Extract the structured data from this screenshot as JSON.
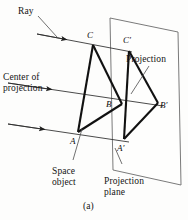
{
  "figure": {
    "caption": "(a)",
    "colors": {
      "ink": "#141414",
      "object_stroke": "#111111",
      "plane_stroke": "#5a5a5a",
      "ray_stroke": "#333333",
      "leader_stroke": "#555555",
      "background": "#fdfdfc"
    },
    "annotations": {
      "ray": "Ray",
      "center_of_projection": "Center of\nprojection",
      "projection": "Projection",
      "space_object": "Space\nobject",
      "projection_plane": "Projection\nplane"
    },
    "vertices": {
      "c": "C",
      "c_prime": "C′",
      "b": "B",
      "b_prime": "B′",
      "a": "A",
      "a_prime": "A′"
    },
    "geometry": {
      "object_triangle": "C(93,44) A(78,131) B(122,104)",
      "projected_triangle": "C′(130,50) A′(124,138) B′(158,103)",
      "projection_plane_quad": "(110,18) (178,32) (181,185) (113,170)",
      "ray_count": 3
    }
  }
}
